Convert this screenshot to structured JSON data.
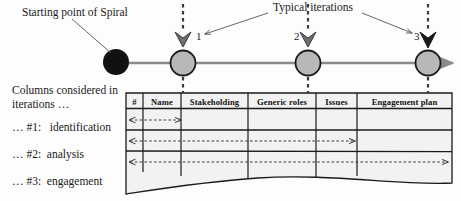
{
  "diagram": {
    "annotations": {
      "starting_point": "Starting point of Spiral",
      "typical_iterations": "Typical iterations"
    },
    "left_panel": {
      "heading_line1": "Columns considered in",
      "heading_line2": "iterations …",
      "items": [
        "… #1:   identification",
        "… #2:  analysis",
        "… #3:  engagement"
      ]
    },
    "iteration_markers": [
      {
        "label": "1",
        "x": 183
      },
      {
        "label": "2",
        "x": 308
      },
      {
        "label": "3",
        "x": 428
      }
    ],
    "table": {
      "columns": [
        "#",
        "Name",
        "Stakeholding",
        "Generic roles",
        "Issues",
        "Engagement plan"
      ],
      "row_count": 3,
      "scope_arrows": [
        {
          "iteration": "1",
          "spans_to_column": "Name"
        },
        {
          "iteration": "2",
          "spans_to_column": "Issues"
        },
        {
          "iteration": "3",
          "spans_to_column": "Engagement plan"
        }
      ]
    },
    "colors": {
      "start_node": "#111111",
      "iteration_node_fill": "#b8b8b8",
      "iteration_node_stroke": "#1a1a1a",
      "timeline": "#8a8a8a",
      "table_fill": "#f2f2f2",
      "table_stroke": "#1a1a1a",
      "dashed": "#4a4a4a",
      "leader_line": "#555555"
    }
  }
}
